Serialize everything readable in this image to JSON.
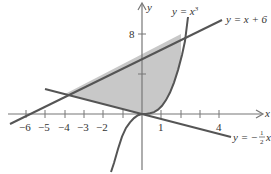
{
  "figure": {
    "type": "region-between-curves",
    "axes": {
      "x_label": "x",
      "y_label": "y",
      "x_ticks": [
        {
          "value": -6,
          "label": "−6"
        },
        {
          "value": -5,
          "label": "−5"
        },
        {
          "value": -4,
          "label": "−4"
        },
        {
          "value": -3,
          "label": "−3"
        },
        {
          "value": -2,
          "label": "−2"
        },
        {
          "value": 1,
          "label": "1"
        },
        {
          "value": 2,
          "label": ""
        },
        {
          "value": 3,
          "label": ""
        },
        {
          "value": 4,
          "label": "4"
        }
      ],
      "y_ticks": [
        {
          "value": 4,
          "label": ""
        },
        {
          "value": 8,
          "label": "8"
        }
      ]
    },
    "curves": [
      {
        "name": "cubic",
        "eq_prefix": "y = x",
        "eq_sup": "3"
      },
      {
        "name": "line-upper",
        "eq": "y = x + 6"
      },
      {
        "name": "line-lower",
        "eq_prefix": "y = −",
        "frac_num": "1",
        "frac_den": "2",
        "eq_suffix": "x"
      }
    ],
    "shaded_region": {
      "description": "Region bounded by y = x + 6, y = x^3 and y = −x/2",
      "vertices": [
        [
          -4,
          2
        ],
        [
          0,
          0
        ],
        [
          2,
          8
        ]
      ],
      "fill": "#c8c8c8"
    },
    "colors": {
      "curve": "#555555",
      "axis": "#777777",
      "shade": "#c8c8c8"
    }
  }
}
